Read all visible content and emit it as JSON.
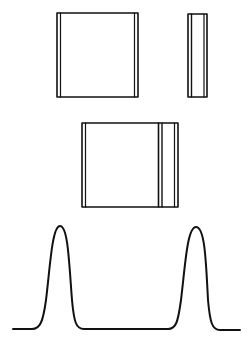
{
  "diagram": {
    "stroke_color": "#111111",
    "background": "#ffffff",
    "shapes": {
      "rect_wide": {
        "x": 57,
        "y": 13,
        "w": 81,
        "h": 84
      },
      "rect_narrow": {
        "x": 188,
        "y": 14,
        "w": 19,
        "h": 83
      },
      "rect_combined": {
        "x": 82,
        "y": 123,
        "w": 96,
        "h": 84,
        "divider_x": 160
      },
      "profile": {
        "baseline_y": 329,
        "x_start": 13,
        "x_end": 240,
        "peaks": [
          {
            "x": 60,
            "y": 226
          },
          {
            "x": 196,
            "y": 227
          }
        ]
      }
    }
  }
}
